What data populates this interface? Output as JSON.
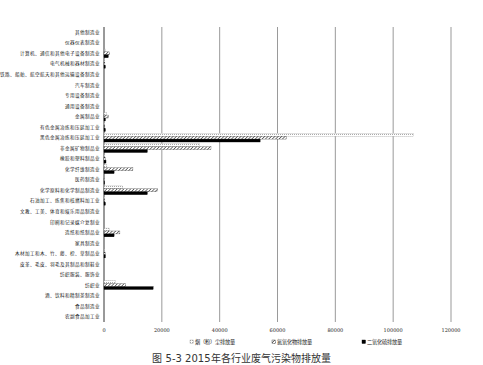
{
  "chart_data": {
    "type": "bar",
    "orientation": "horizontal",
    "title": "",
    "caption": "图 5-3 2015年各行业废气污染物排放量",
    "xlabel": "",
    "ylabel": "",
    "xlim": [
      0,
      120000
    ],
    "x_ticks": [
      "0",
      "20000",
      "40000",
      "60000",
      "80000",
      "100000",
      "120000"
    ],
    "grid": true,
    "legend_position": "bottom",
    "categories": [
      "其他制造业",
      "仪器仪表制造业",
      "计算机、通信和其他电子设备制造业",
      "电气机械和器材制造业",
      "铁路、船舶、航空航天和其他运输设备制造业",
      "汽车制造业",
      "专用设备制造业",
      "通用设备制造业",
      "金属制品业",
      "有色金属冶炼和压延加工业",
      "黑色金属冶炼和压延加工业",
      "非金属矿物制品业",
      "橡胶和塑料制品业",
      "化学纤维制造业",
      "医药制造业",
      "化学原料和化学制品制造业",
      "石油加工、炼焦和核燃料加工业",
      "文教、工美、体育和娱乐用品制造业",
      "印刷和记录媒介复制业",
      "造纸和纸制品业",
      "家具制造业",
      "木材加工和木、竹、藤、棕、草制品业",
      "皮革、毛皮、羽毛及其制品和制鞋业",
      "纺织服装、服饰业",
      "纺织业",
      "酒、饮料和精制茶制造业",
      "食品制造业",
      "农副食品加工业"
    ],
    "series": [
      {
        "name": "烟（粉）尘排放量",
        "style": "outline",
        "values": [
          0,
          0,
          500,
          100,
          0,
          0,
          0,
          0,
          800,
          200,
          107000,
          33000,
          300,
          1000,
          0,
          6500,
          200,
          0,
          0,
          2000,
          0,
          300,
          0,
          0,
          4000,
          0,
          0,
          0
        ]
      },
      {
        "name": "氮氧化物排放量",
        "style": "hatched",
        "values": [
          0,
          0,
          2000,
          300,
          0,
          0,
          0,
          0,
          1500,
          300,
          63000,
          37000,
          500,
          10000,
          100,
          18500,
          300,
          0,
          0,
          5500,
          0,
          500,
          0,
          0,
          7500,
          0,
          0,
          0
        ]
      },
      {
        "name": "二氧化硫排放量",
        "style": "solid",
        "values": [
          0,
          0,
          1500,
          500,
          0,
          0,
          0,
          0,
          500,
          500,
          54000,
          15000,
          700,
          3500,
          100,
          15000,
          500,
          0,
          0,
          3500,
          0,
          500,
          0,
          0,
          17000,
          0,
          0,
          0
        ]
      }
    ],
    "colors": {
      "outline": "#9a9a9a",
      "hatched": "#333333",
      "solid": "#000000",
      "gridline": "#555555"
    }
  }
}
